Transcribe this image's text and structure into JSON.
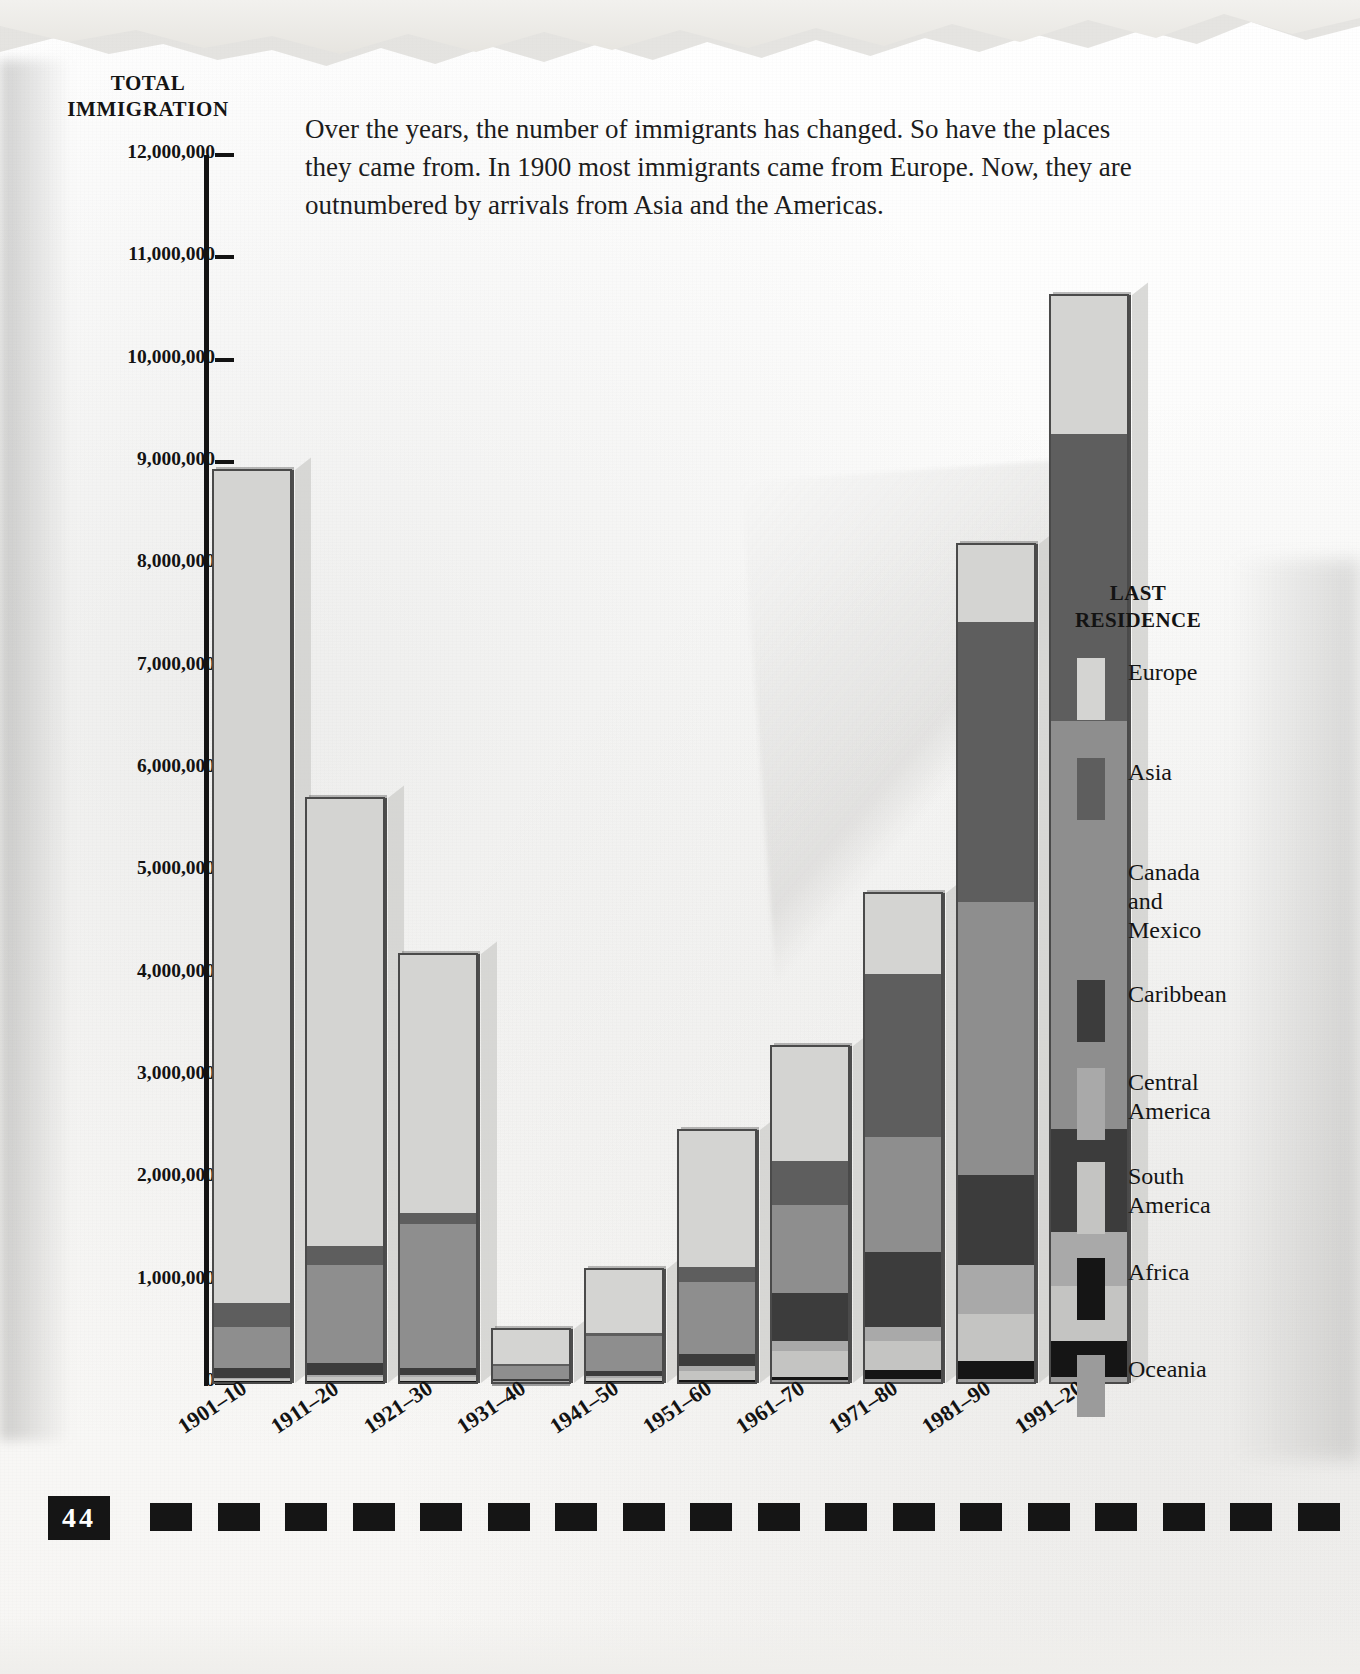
{
  "page": {
    "number": "44",
    "axis_title_line1": "TOTAL",
    "axis_title_line2": "IMMIGRATION",
    "intro": "Over the years, the number of immigrants has changed. So have the places they came from. In 1900 most immigrants came from Europe. Now, they are outnumbered by arrivals from Asia and the Americas."
  },
  "legend": {
    "title_line1": "LAST",
    "title_line2": "RESIDENCE"
  },
  "chart_data": {
    "type": "bar",
    "title": "TOTAL IMMIGRATION",
    "subtype": "stacked-bar",
    "xlabel": "",
    "ylabel": "TOTAL IMMIGRATION",
    "ylim": [
      0,
      12000000
    ],
    "grid": false,
    "legend_position": "right",
    "ytick_labels": [
      "12,000,000",
      "11,000,000",
      "10,000,000",
      "9,000,000",
      "8,000,000",
      "7,000,000",
      "6,000,000",
      "5,000,000",
      "4,000,000",
      "3,000,000",
      "2,000,000",
      "1,000,000",
      "0"
    ],
    "ytick_values": [
      12000000,
      11000000,
      10000000,
      9000000,
      8000000,
      7000000,
      6000000,
      5000000,
      4000000,
      3000000,
      2000000,
      1000000,
      0
    ],
    "categories": [
      "1901–10",
      "1911–20",
      "1921–30",
      "1931–40",
      "1941–50",
      "1951–60",
      "1961–70",
      "1971–80",
      "1981–90",
      "1991–2000"
    ],
    "totals": [
      8930000,
      5940000,
      4280000,
      570000,
      1140000,
      2780000,
      4170000,
      5680000,
      9180000,
      11110000
    ],
    "series": [
      {
        "name": "Europe",
        "color": "#d4d4d2",
        "values": [
          8140000,
          4380000,
          2530000,
          350000,
          620000,
          1330000,
          1120000,
          800000,
          760000,
          1360000
        ]
      },
      {
        "name": "Asia",
        "color": "#5e5e5e",
        "values": [
          240000,
          190000,
          110000,
          16000,
          32000,
          150000,
          430000,
          1590000,
          2740000,
          2800000
        ]
      },
      {
        "name": "Canada and Mexico",
        "color": "#8e8e8e",
        "values": [
          400000,
          950000,
          1400000,
          130000,
          340000,
          700000,
          860000,
          1120000,
          2670000,
          3990000
        ]
      },
      {
        "name": "Caribbean",
        "color": "#3c3c3c",
        "values": [
          100000,
          120000,
          75000,
          16000,
          50000,
          125000,
          470000,
          740000,
          880000,
          1000000
        ]
      },
      {
        "name": "Central America",
        "color": "#a9a9a9",
        "values": [
          8000,
          17000,
          16000,
          6000,
          21000,
          45000,
          100000,
          135000,
          470000,
          530000
        ]
      },
      {
        "name": "South America",
        "color": "#c4c4c2",
        "values": [
          18000,
          42000,
          43000,
          10000,
          25000,
          92000,
          260000,
          285000,
          460000,
          540000
        ]
      },
      {
        "name": "Africa",
        "color": "#151515",
        "values": [
          8000,
          8000,
          6000,
          2000,
          7000,
          14000,
          29000,
          81000,
          177000,
          355000
        ]
      },
      {
        "name": "Oceania",
        "color": "#9b9b9b",
        "values": [
          12000,
          13000,
          9000,
          2500,
          15000,
          12000,
          25000,
          42000,
          42000,
          55000
        ]
      }
    ]
  }
}
